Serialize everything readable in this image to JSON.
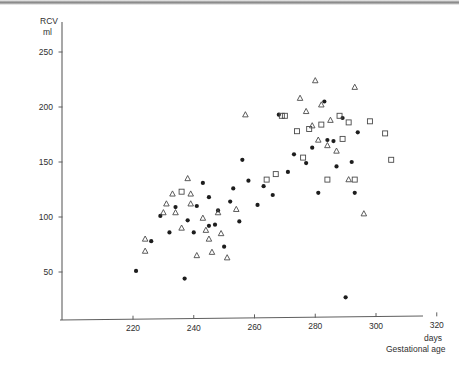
{
  "figure": {
    "background": "#ffffff",
    "ink_color": "#1d1d1d",
    "open_marker_color": "#4a4a4a"
  },
  "axes": {
    "y_title_line1": "RCV",
    "y_title_line2": "ml",
    "x_title_line1": "days",
    "x_title_line2": "Gestational age",
    "y_ticks": [
      "250",
      "200",
      "150",
      "100",
      "50"
    ],
    "x_ticks": [
      "220",
      "240",
      "260",
      "280",
      "300",
      "320"
    ]
  },
  "chart_data": {
    "type": "scatter",
    "title": "",
    "xlabel": "Gestational age (days)",
    "ylabel": "RCV (ml)",
    "xlim": [
      205,
      330
    ],
    "ylim": [
      0,
      262
    ],
    "grid": false,
    "legend": "none",
    "x_ticks": [
      220,
      240,
      260,
      280,
      300,
      320
    ],
    "y_ticks": [
      50,
      100,
      150,
      200,
      250
    ],
    "series": [
      {
        "name": "filled-circle",
        "marker": "circle-filled",
        "points": [
          [
            221,
            51
          ],
          [
            226,
            78
          ],
          [
            229,
            101
          ],
          [
            232,
            86
          ],
          [
            234,
            109
          ],
          [
            237,
            44
          ],
          [
            238,
            97
          ],
          [
            240,
            86
          ],
          [
            241,
            110
          ],
          [
            243,
            131
          ],
          [
            245,
            92
          ],
          [
            245,
            118
          ],
          [
            247,
            93
          ],
          [
            248,
            106
          ],
          [
            250,
            73
          ],
          [
            252,
            114
          ],
          [
            253,
            126
          ],
          [
            255,
            96
          ],
          [
            256,
            152
          ],
          [
            258,
            133
          ],
          [
            261,
            111
          ],
          [
            263,
            128
          ],
          [
            266,
            120
          ],
          [
            268,
            193
          ],
          [
            271,
            141
          ],
          [
            273,
            157
          ],
          [
            277,
            149
          ],
          [
            279,
            163
          ],
          [
            281,
            122
          ],
          [
            283,
            205
          ],
          [
            284,
            170
          ],
          [
            286,
            169
          ],
          [
            287,
            146
          ],
          [
            289,
            190
          ],
          [
            290,
            27
          ],
          [
            292,
            150
          ],
          [
            293,
            122
          ],
          [
            294,
            177
          ]
        ]
      },
      {
        "name": "open-triangle",
        "marker": "triangle-open",
        "points": [
          [
            224,
            80
          ],
          [
            224,
            69
          ],
          [
            230,
            104
          ],
          [
            231,
            112
          ],
          [
            233,
            121
          ],
          [
            234,
            104
          ],
          [
            236,
            90
          ],
          [
            238,
            135
          ],
          [
            239,
            121
          ],
          [
            239,
            112
          ],
          [
            241,
            65
          ],
          [
            243,
            99
          ],
          [
            244,
            88
          ],
          [
            245,
            80
          ],
          [
            246,
            68
          ],
          [
            248,
            104
          ],
          [
            249,
            85
          ],
          [
            251,
            63
          ],
          [
            254,
            107
          ],
          [
            257,
            193
          ],
          [
            275,
            208
          ],
          [
            277,
            196
          ],
          [
            279,
            183
          ],
          [
            280,
            224
          ],
          [
            281,
            170
          ],
          [
            282,
            202
          ],
          [
            284,
            165
          ],
          [
            285,
            188
          ],
          [
            287,
            160
          ],
          [
            291,
            134
          ],
          [
            293,
            218
          ],
          [
            296,
            103
          ]
        ]
      },
      {
        "name": "open-square",
        "marker": "square-open",
        "points": [
          [
            236,
            123
          ],
          [
            264,
            134
          ],
          [
            267,
            139
          ],
          [
            269,
            192
          ],
          [
            270,
            192
          ],
          [
            274,
            178
          ],
          [
            276,
            154
          ],
          [
            278,
            180
          ],
          [
            282,
            184
          ],
          [
            284,
            134
          ],
          [
            288,
            192
          ],
          [
            289,
            171
          ],
          [
            291,
            186
          ],
          [
            293,
            134
          ],
          [
            298,
            187
          ],
          [
            303,
            176
          ],
          [
            305,
            152
          ]
        ]
      }
    ]
  }
}
